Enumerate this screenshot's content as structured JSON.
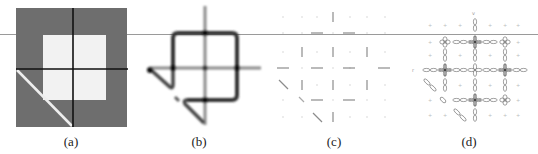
{
  "figure": {
    "panels": [
      {
        "id": "a",
        "caption": "(a)",
        "description": "Gray square with white inner square, black cross lines and white diagonal line"
      },
      {
        "id": "b",
        "caption": "(b)",
        "description": "Blurred line-segment response map with junction blobs"
      },
      {
        "id": "c",
        "caption": "(c)",
        "description": "Sparse grid of oriented line segments"
      },
      {
        "id": "d",
        "caption": "(d)",
        "description": "Grid of orientation glyphs (petal/cross shapes)"
      }
    ],
    "colors": {
      "panel_a_gray": "#6e6e6e",
      "panel_a_white": "#f2f2f2",
      "line_black": "#111111",
      "divider_gray": "#9a9a9a",
      "glyph_gray": "#888888"
    }
  }
}
